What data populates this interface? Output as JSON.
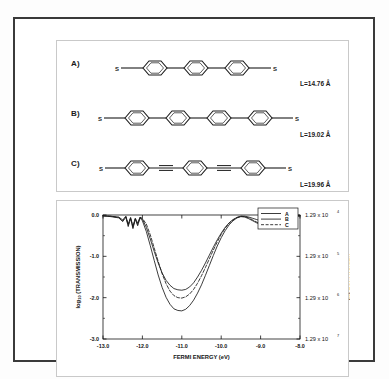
{
  "figure": {
    "panels": {
      "structures_label": "molecular-structures-panel",
      "chart_label": "transmission-chart-panel"
    }
  },
  "structures": [
    {
      "id": "A",
      "label": "A)",
      "length_label": "L=14.76 Å",
      "rings": 3,
      "linkers": "single-bond",
      "left_terminal": "S",
      "right_terminal": "S"
    },
    {
      "id": "B",
      "label": "B)",
      "length_label": "L=19.02 Å",
      "rings": 4,
      "linkers": "single-bond",
      "left_terminal": "S",
      "right_terminal": "S"
    },
    {
      "id": "C",
      "label": "C)",
      "length_label": "L=19.96 Å",
      "rings": 3,
      "linkers": "triple-bond",
      "left_terminal": "S",
      "right_terminal": "S"
    }
  ],
  "chart_data": {
    "type": "line",
    "title": "",
    "xlabel": "FERMI ENERGY  (eV)",
    "ylabel": "log10 (TRANSMISSION)",
    "y2label": "RESISTANCE  (Ω)",
    "xlim": [
      -13.0,
      -8.0
    ],
    "ylim": [
      -3.0,
      0.0
    ],
    "grid": false,
    "legend_position": "top-right",
    "xticks": [
      -13.0,
      -12.0,
      -11.0,
      -10.0,
      -9.0,
      -8.0
    ],
    "xticklabels": [
      "-13.0",
      "-12.0",
      "-11.0",
      "-10.0",
      "-9.0",
      "-8.0"
    ],
    "yticks": [
      0.0,
      -1.0,
      -2.0,
      -3.0
    ],
    "yticklabels": [
      "0.0",
      "-1.0",
      "-2.0",
      "-3.0"
    ],
    "y2ticks": [
      0.0,
      -1.0,
      -2.0,
      -3.0
    ],
    "y2ticklabels": [
      "1.29 x 10",
      "1.29 x 10",
      "1.29 x 10",
      "1.29 x 10"
    ],
    "y2exponents": [
      "4",
      "5",
      "6",
      "7"
    ],
    "legend": [
      {
        "name": "A",
        "style": "solid"
      },
      {
        "name": "B",
        "style": "solid"
      },
      {
        "name": "C",
        "style": "dashed"
      }
    ],
    "series": [
      {
        "name": "A",
        "style": "solid",
        "x": [
          -13.0,
          -12.8,
          -12.6,
          -12.5,
          -12.42,
          -12.36,
          -12.3,
          -12.24,
          -12.18,
          -12.12,
          -12.06,
          -12.0,
          -11.9,
          -11.8,
          -11.7,
          -11.6,
          -11.5,
          -11.4,
          -11.3,
          -11.2,
          -11.1,
          -11.0,
          -10.9,
          -10.8,
          -10.7,
          -10.6,
          -10.5,
          -10.4,
          -10.3,
          -10.2,
          -10.1,
          -10.0,
          -9.9,
          -9.8,
          -9.7,
          -9.6,
          -9.5,
          -9.4,
          -9.3,
          -9.2,
          -9.1,
          -9.0,
          -8.9,
          -8.8,
          -8.7,
          -8.6,
          -8.5,
          -8.4,
          -8.3,
          -8.2,
          -8.1,
          -8.0
        ],
        "y": [
          -0.02,
          -0.03,
          -0.05,
          -0.12,
          -0.03,
          -0.22,
          -0.06,
          -0.27,
          -0.08,
          -0.2,
          -0.05,
          -0.1,
          -0.3,
          -0.58,
          -0.88,
          -1.16,
          -1.4,
          -1.58,
          -1.7,
          -1.78,
          -1.81,
          -1.82,
          -1.8,
          -1.74,
          -1.64,
          -1.5,
          -1.34,
          -1.16,
          -0.97,
          -0.78,
          -0.6,
          -0.44,
          -0.3,
          -0.19,
          -0.11,
          -0.06,
          -0.03,
          -0.03,
          -0.05,
          -0.08,
          -0.11,
          -0.14,
          -0.16,
          -0.17,
          -0.16,
          -0.13,
          -0.09,
          -0.06,
          -0.04,
          -0.03,
          -0.02,
          -0.02
        ]
      },
      {
        "name": "B",
        "style": "dashed",
        "x": [
          -13.0,
          -12.8,
          -12.6,
          -12.5,
          -12.42,
          -12.36,
          -12.3,
          -12.24,
          -12.18,
          -12.12,
          -12.06,
          -12.0,
          -11.9,
          -11.8,
          -11.7,
          -11.6,
          -11.5,
          -11.4,
          -11.3,
          -11.2,
          -11.1,
          -11.0,
          -10.9,
          -10.8,
          -10.7,
          -10.6,
          -10.5,
          -10.4,
          -10.3,
          -10.2,
          -10.1,
          -10.0,
          -9.9,
          -9.8,
          -9.7,
          -9.6,
          -9.5,
          -9.4,
          -9.3,
          -9.2,
          -9.1,
          -9.0,
          -8.9,
          -8.8,
          -8.7,
          -8.6,
          -8.5,
          -8.4,
          -8.3,
          -8.2,
          -8.1,
          -8.0
        ],
        "y": [
          -0.02,
          -0.03,
          -0.06,
          -0.14,
          -0.04,
          -0.25,
          -0.07,
          -0.3,
          -0.09,
          -0.23,
          -0.06,
          -0.08,
          -0.22,
          -0.48,
          -0.8,
          -1.12,
          -1.42,
          -1.66,
          -1.84,
          -1.95,
          -2.0,
          -2.01,
          -1.98,
          -1.91,
          -1.8,
          -1.65,
          -1.47,
          -1.27,
          -1.06,
          -0.85,
          -0.65,
          -0.47,
          -0.32,
          -0.2,
          -0.12,
          -0.06,
          -0.03,
          -0.04,
          -0.07,
          -0.12,
          -0.17,
          -0.21,
          -0.23,
          -0.23,
          -0.21,
          -0.17,
          -0.12,
          -0.08,
          -0.05,
          -0.03,
          -0.02,
          -0.02
        ]
      },
      {
        "name": "C",
        "style": "solid",
        "x": [
          -13.0,
          -12.8,
          -12.6,
          -12.5,
          -12.42,
          -12.36,
          -12.3,
          -12.24,
          -12.18,
          -12.12,
          -12.06,
          -12.0,
          -11.9,
          -11.8,
          -11.7,
          -11.6,
          -11.5,
          -11.4,
          -11.3,
          -11.2,
          -11.1,
          -11.0,
          -10.9,
          -10.8,
          -10.7,
          -10.6,
          -10.5,
          -10.4,
          -10.3,
          -10.2,
          -10.1,
          -10.0,
          -9.9,
          -9.8,
          -9.7,
          -9.6,
          -9.5,
          -9.4,
          -9.3,
          -9.2,
          -9.1,
          -9.0,
          -8.9,
          -8.8,
          -8.7,
          -8.6,
          -8.5,
          -8.4,
          -8.3,
          -8.2,
          -8.1,
          -8.0
        ],
        "y": [
          -0.02,
          -0.04,
          -0.07,
          -0.16,
          -0.05,
          -0.28,
          -0.08,
          -0.33,
          -0.1,
          -0.26,
          -0.07,
          -0.14,
          -0.4,
          -0.74,
          -1.1,
          -1.45,
          -1.75,
          -1.99,
          -2.16,
          -2.27,
          -2.31,
          -2.32,
          -2.28,
          -2.19,
          -2.06,
          -1.89,
          -1.69,
          -1.46,
          -1.22,
          -0.98,
          -0.75,
          -0.55,
          -0.38,
          -0.24,
          -0.14,
          -0.07,
          -0.04,
          -0.05,
          -0.09,
          -0.14,
          -0.19,
          -0.23,
          -0.25,
          -0.25,
          -0.23,
          -0.19,
          -0.14,
          -0.09,
          -0.06,
          -0.04,
          -0.03,
          -0.02
        ]
      }
    ]
  },
  "colors": {
    "frame": "#3a3a3a",
    "panel_border": "#c9c9c9",
    "axis": "#141414",
    "curve": "#1a1a1a",
    "background": "#ffffff"
  }
}
